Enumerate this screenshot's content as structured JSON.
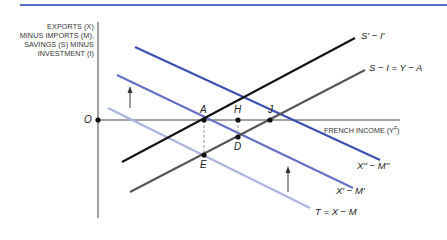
{
  "figure": {
    "y_axis_label_lines": [
      "EXPORTS (X)",
      "MINUS IMPORTS (M),",
      "SAVINGS (S) MINUS",
      "INVESTMENT (I)"
    ],
    "x_axis_label": "FRENCH INCOME (Y",
    "x_axis_label_sup": "F",
    "x_axis_label_close": ")",
    "origin_label": "O",
    "colors": {
      "top_rule": "#5a6fc0",
      "s_prime_i_prime": "#111111",
      "s_minus_i": "#555555",
      "x2_m2": "#3a4fb0",
      "x1_m1": "#6470c4",
      "t": "#a9b4e0",
      "axis": "#444444"
    }
  },
  "curves": {
    "s_prime_i_prime": {
      "label": "S' − I'"
    },
    "s_minus_i": {
      "label": "S − I = Y − A"
    },
    "x2_m2": {
      "label": "X'' − M''"
    },
    "x1_m1": {
      "label": "X' − M'"
    },
    "t": {
      "label": "T = X − M"
    }
  },
  "points": {
    "A": "A",
    "H": "H",
    "J": "J",
    "D": "D",
    "E": "E"
  }
}
